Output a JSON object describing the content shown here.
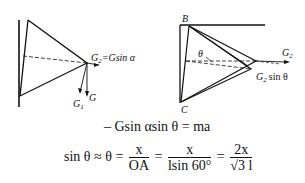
{
  "figure_left": {
    "labels": {
      "g2": "G",
      "g2_sub": "2",
      "g2_rest": "=Gsin α",
      "g1": "G",
      "g1_sub": "1",
      "g": "G"
    }
  },
  "figure_right": {
    "labels": {
      "b": "B",
      "c": "C",
      "theta": "θ",
      "g2": "G",
      "g2_sub": "2",
      "g2sin": "G",
      "g2sin_sub": "2",
      "g2sin_rest": "sin θ"
    }
  },
  "equations": {
    "eq1": "– Gsin αsin θ = ma",
    "eq2_lhs": "sin θ ≈ θ =",
    "frac1_num": "x",
    "frac1_den": "OA",
    "eq_sign1": "=",
    "frac2_num": "x",
    "frac2_den": "lsin 60°",
    "eq_sign2": "=",
    "frac3_num": "2x",
    "frac3_den": "√3 l"
  }
}
